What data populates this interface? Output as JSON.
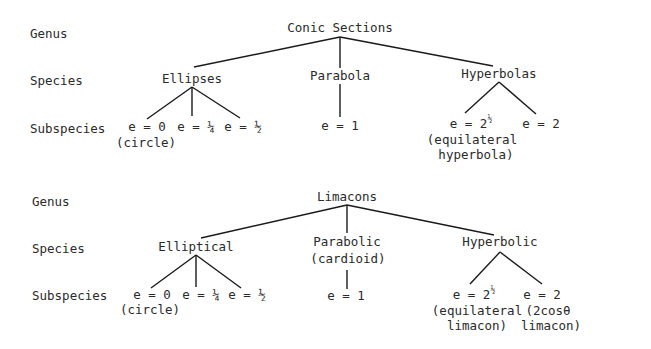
{
  "trees": [
    {
      "levels": {
        "genus": "Genus",
        "species": "Species",
        "subspecies": "Subspecies"
      },
      "root": "Conic Sections",
      "species": [
        {
          "label": "Ellipses",
          "note": "",
          "subspecies": [
            {
              "label": "e = 0",
              "note": "(circle)"
            },
            {
              "label": "e = ¼",
              "note": ""
            },
            {
              "label": "e = ½",
              "note": ""
            }
          ]
        },
        {
          "label": "Parabola",
          "note": "",
          "subspecies": [
            {
              "label": "e = 1",
              "note": ""
            }
          ]
        },
        {
          "label": "Hyperbolas",
          "note": "",
          "subspecies": [
            {
              "label": "e = 2",
              "sup": "½",
              "note": "(equilateral",
              "note2": "hyperbola)"
            },
            {
              "label": "e = 2",
              "note": ""
            }
          ]
        }
      ]
    },
    {
      "levels": {
        "genus": "Genus",
        "species": "Species",
        "subspecies": "Subspecies"
      },
      "root": "Limacons",
      "species": [
        {
          "label": "Elliptical",
          "note": "",
          "subspecies": [
            {
              "label": "e = 0",
              "note": "(circle)"
            },
            {
              "label": "e = ¼",
              "note": ""
            },
            {
              "label": "e = ½",
              "note": ""
            }
          ]
        },
        {
          "label": "Parabolic",
          "note": "(cardioid)",
          "subspecies": [
            {
              "label": "e = 1",
              "note": ""
            }
          ]
        },
        {
          "label": "Hyperbolic",
          "note": "",
          "subspecies": [
            {
              "label": "e = 2",
              "sup": "½",
              "note": "(equilateral",
              "note2": "limacon)"
            },
            {
              "label": "e = 2",
              "note": "(2cosθ",
              "note2": "limacon)"
            }
          ]
        }
      ]
    }
  ]
}
